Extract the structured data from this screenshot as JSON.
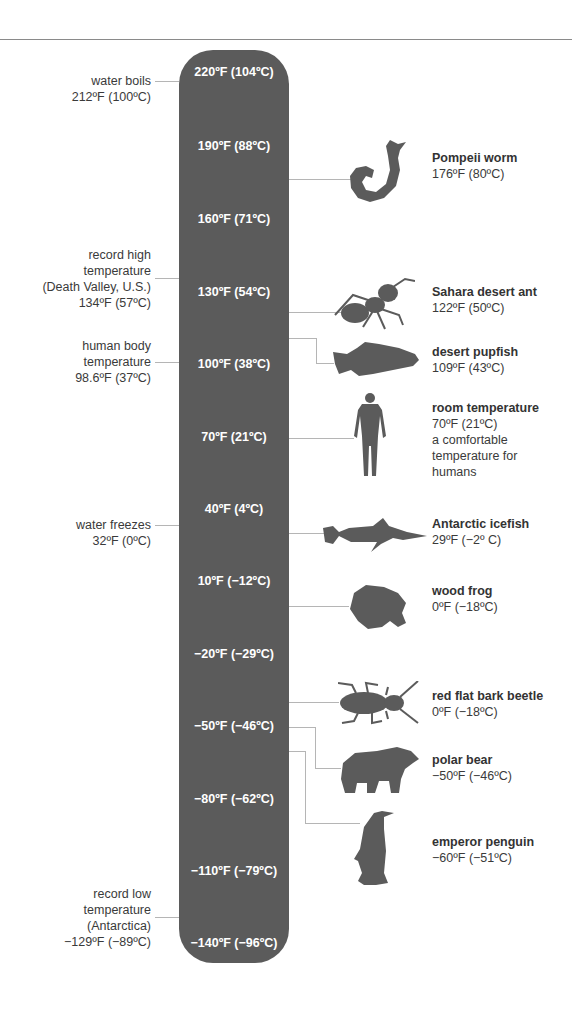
{
  "colors": {
    "bar": "#5b5b5b",
    "silhouette": "#5b5b5b",
    "connector": "#b5b5b5",
    "text": "#3a3a3a",
    "tick_text": "#ffffff"
  },
  "scale": {
    "ticks": [
      {
        "label": "220ºF (104ºC)",
        "f": 220,
        "c": 104
      },
      {
        "label": "190ºF (88ºC)",
        "f": 190,
        "c": 88
      },
      {
        "label": "160ºF (71ºC)",
        "f": 160,
        "c": 71
      },
      {
        "label": "130ºF (54ºC)",
        "f": 130,
        "c": 54
      },
      {
        "label": "100ºF (38ºC)",
        "f": 100,
        "c": 38
      },
      {
        "label": "70ºF (21ºC)",
        "f": 70,
        "c": 21
      },
      {
        "label": "40ºF (4ºC)",
        "f": 40,
        "c": 4
      },
      {
        "label": "10ºF (−12ºC)",
        "f": 10,
        "c": -12
      },
      {
        "label": "−20ºF (−29ºC)",
        "f": -20,
        "c": -29
      },
      {
        "label": "−50ºF (−46ºC)",
        "f": -50,
        "c": -46
      },
      {
        "label": "−80ºF (−62ºC)",
        "f": -80,
        "c": -62
      },
      {
        "label": "−110ºF (−79ºC)",
        "f": -110,
        "c": -79
      },
      {
        "label": "−140ºF (−96ºC)",
        "f": -140,
        "c": -96
      }
    ]
  },
  "left_notes": [
    {
      "lines": [
        "water boils",
        "212ºF (100ºC)"
      ]
    },
    {
      "lines": [
        "record high",
        "temperature",
        "(Death Valley, U.S.)",
        "134ºF (57ºC)"
      ]
    },
    {
      "lines": [
        "human body",
        "temperature",
        "98.6ºF (37ºC)"
      ]
    },
    {
      "lines": [
        "water freezes",
        "32ºF (0ºC)"
      ]
    },
    {
      "lines": [
        "record low",
        "temperature",
        "(Antarctica)",
        "−129ºF (−89ºC)"
      ]
    }
  ],
  "organisms": [
    {
      "name": "Pompeii worm",
      "temp": "176ºF (80ºC)",
      "icon": "worm-icon"
    },
    {
      "name": "Sahara desert ant",
      "temp": "122ºF (50ºC)",
      "icon": "ant-icon"
    },
    {
      "name": "desert pupfish",
      "temp": "109ºF (43ºC)",
      "icon": "pupfish-icon"
    },
    {
      "name": "room temperature",
      "temp": "70ºF (21ºC)",
      "note": [
        "a comfortable",
        "temperature for",
        "humans"
      ],
      "icon": "human-icon"
    },
    {
      "name": "Antarctic icefish",
      "temp": "29ºF (−2º C)",
      "icon": "icefish-icon"
    },
    {
      "name": "wood frog",
      "temp": "0ºF (−18ºC)",
      "icon": "frog-icon"
    },
    {
      "name": "red flat bark beetle",
      "temp": "0ºF (−18ºC)",
      "icon": "beetle-icon"
    },
    {
      "name": "polar bear",
      "temp": "−50ºF (−46ºC)",
      "icon": "polar-bear-icon"
    },
    {
      "name": "emperor penguin",
      "temp": "−60ºF (−51ºC)",
      "icon": "penguin-icon"
    }
  ]
}
